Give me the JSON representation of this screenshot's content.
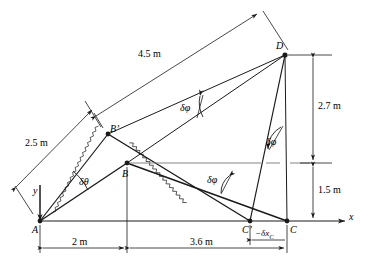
{
  "figure": {
    "background": "#ffffff",
    "line_color": "#1a1a1a",
    "width": 369,
    "height": 267
  },
  "axes": {
    "x_label": "x",
    "y_label": "y",
    "origin_point": "A"
  },
  "points": [
    {
      "key": "A",
      "label": "A",
      "x": 40,
      "y": 221
    },
    {
      "key": "B",
      "label": "B",
      "x": 127,
      "y": 163
    },
    {
      "key": "Bp",
      "label": "B'",
      "x": 108,
      "y": 134
    },
    {
      "key": "C",
      "label": "C",
      "x": 287,
      "y": 221
    },
    {
      "key": "Cp",
      "label": "C'",
      "x": 250,
      "y": 221
    },
    {
      "key": "D",
      "label": "D",
      "x": 285,
      "y": 55
    }
  ],
  "dimensions": [
    {
      "name": "bar-AB-length",
      "text": "2.5 m",
      "value": 2.5,
      "unit": "m"
    },
    {
      "name": "bar-BD-length",
      "text": "4.5 m",
      "value": 4.5,
      "unit": "m"
    },
    {
      "name": "height-upper",
      "text": "2.7 m",
      "value": 2.7,
      "unit": "m"
    },
    {
      "name": "height-lower",
      "text": "1.5 m",
      "value": 1.5,
      "unit": "m"
    },
    {
      "name": "span-A-to-B",
      "text": "2 m",
      "value": 2.0,
      "unit": "m"
    },
    {
      "name": "span-B-to-C",
      "text": "3.6 m",
      "value": 3.6,
      "unit": "m"
    },
    {
      "name": "virtual-disp-C",
      "text": "−δx_C",
      "value": null,
      "unit": ""
    }
  ],
  "angles": [
    {
      "name": "delta-theta-at-A",
      "text": "δθ"
    },
    {
      "name": "delta-phi-at-B",
      "text": "δφ"
    },
    {
      "name": "delta-phi-at-C",
      "text": "δφ"
    },
    {
      "name": "delta-phi-at-D",
      "text": "δφ"
    }
  ],
  "labels": {
    "A": "A",
    "B": "B",
    "Bprime": "B’",
    "C": "C",
    "Cprime": "C’",
    "D": "D",
    "x": "x",
    "y": "y",
    "len_25": "2.5 m",
    "len_45": "4.5 m",
    "len_27": "2.7 m",
    "len_15": "1.5 m",
    "len_2": "2 m",
    "len_36": "3.6 m",
    "dxc": "−δx",
    "dxc_sub": "C",
    "dtheta": "δθ",
    "dphi1": "δφ",
    "dphi2": "δφ",
    "dphi3": "δφ"
  }
}
